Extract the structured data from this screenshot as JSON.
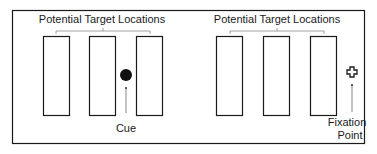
{
  "diagram": {
    "panels": [
      {
        "name": "cue-panel",
        "header_label": "Potential Target Locations",
        "locations_count": 3,
        "marker": {
          "type": "cue",
          "shape": "filled-circle",
          "label": "Cue"
        }
      },
      {
        "name": "fixation-panel",
        "header_label": "Potential Target Locations",
        "locations_count": 3,
        "marker": {
          "type": "fixation",
          "shape": "outlined-cross",
          "label_line1": "Fixation",
          "label_line2": "Point"
        }
      }
    ],
    "colors": {
      "stroke": "#1a1a1a",
      "bracket": "#8a8a8a",
      "background": "#ffffff"
    }
  }
}
